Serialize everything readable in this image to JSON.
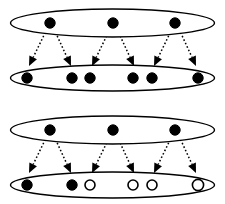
{
  "figure": {
    "type": "diagram",
    "background_color": "#ffffff",
    "stroke_color": "#000000",
    "fill_filled": "#000000",
    "fill_hollow": "#ffffff",
    "canvas": {
      "width": 225,
      "height": 204
    },
    "panels": [
      {
        "name": "upper-panel",
        "label": "",
        "ellipses": [
          {
            "name": "upper-panel-top-ellipse",
            "cx": 112.5,
            "cy": 23,
            "rx": 102,
            "ry": 14,
            "stroke_width": 1.4,
            "nodes": [
              {
                "name": "node-a1",
                "cx": 50,
                "cy": 23,
                "r": 5.2,
                "state": "filled",
                "label": ""
              },
              {
                "name": "node-a2",
                "cx": 113,
                "cy": 23,
                "r": 5.2,
                "state": "filled",
                "label": ""
              },
              {
                "name": "node-a3",
                "cx": 175,
                "cy": 23,
                "r": 5.2,
                "state": "filled",
                "label": ""
              }
            ]
          },
          {
            "name": "upper-panel-bottom-ellipse",
            "cx": 112.5,
            "cy": 78,
            "rx": 102,
            "ry": 13,
            "stroke_width": 1.4,
            "nodes": [
              {
                "name": "node-b1",
                "cx": 27,
                "cy": 78,
                "r": 5.2,
                "state": "filled",
                "label": ""
              },
              {
                "name": "node-b2",
                "cx": 72,
                "cy": 78,
                "r": 5.2,
                "state": "filled",
                "label": ""
              },
              {
                "name": "node-b3",
                "cx": 90,
                "cy": 78,
                "r": 5.2,
                "state": "filled",
                "label": ""
              },
              {
                "name": "node-b4",
                "cx": 133,
                "cy": 78,
                "r": 5.2,
                "state": "filled",
                "label": ""
              },
              {
                "name": "node-b5",
                "cx": 152,
                "cy": 78,
                "r": 5.2,
                "state": "filled",
                "label": ""
              },
              {
                "name": "node-b6",
                "cx": 198,
                "cy": 78,
                "r": 5.2,
                "state": "filled",
                "label": ""
              }
            ]
          }
        ],
        "arrows": [
          {
            "name": "arrow-a1-b1",
            "x1": 47,
            "y1": 29,
            "x2": 29,
            "y2": 66,
            "style": "dotted",
            "head": "solid-triangle"
          },
          {
            "name": "arrow-a1-b2",
            "x1": 54,
            "y1": 29,
            "x2": 71,
            "y2": 66,
            "style": "dotted",
            "head": "solid-triangle"
          },
          {
            "name": "arrow-a2-b3",
            "x1": 110,
            "y1": 29,
            "x2": 92,
            "y2": 66,
            "style": "dotted",
            "head": "solid-triangle"
          },
          {
            "name": "arrow-a2-b4",
            "x1": 117,
            "y1": 29,
            "x2": 134,
            "y2": 66,
            "style": "dotted",
            "head": "solid-triangle"
          },
          {
            "name": "arrow-a3-b5",
            "x1": 172,
            "y1": 29,
            "x2": 154,
            "y2": 66,
            "style": "dotted",
            "head": "solid-triangle"
          },
          {
            "name": "arrow-a3-b6",
            "x1": 179,
            "y1": 29,
            "x2": 196,
            "y2": 66,
            "style": "dotted",
            "head": "solid-triangle"
          }
        ]
      },
      {
        "name": "lower-panel",
        "label": "",
        "ellipses": [
          {
            "name": "lower-panel-top-ellipse",
            "cx": 112.5,
            "cy": 130,
            "rx": 102,
            "ry": 14,
            "stroke_width": 1.4,
            "nodes": [
              {
                "name": "node-c1",
                "cx": 50,
                "cy": 130,
                "r": 5.2,
                "state": "filled",
                "label": ""
              },
              {
                "name": "node-c2",
                "cx": 113,
                "cy": 130,
                "r": 5.2,
                "state": "filled",
                "label": ""
              },
              {
                "name": "node-c3",
                "cx": 175,
                "cy": 130,
                "r": 5.2,
                "state": "filled",
                "label": ""
              }
            ]
          },
          {
            "name": "lower-panel-bottom-ellipse",
            "cx": 112.5,
            "cy": 185,
            "rx": 102,
            "ry": 13,
            "stroke_width": 1.4,
            "nodes": [
              {
                "name": "node-d1",
                "cx": 27,
                "cy": 185,
                "r": 5.2,
                "state": "filled",
                "label": ""
              },
              {
                "name": "node-d2",
                "cx": 72,
                "cy": 185,
                "r": 5.2,
                "state": "filled",
                "label": ""
              },
              {
                "name": "node-d3",
                "cx": 90,
                "cy": 185,
                "r": 5.0,
                "state": "hollow",
                "label": ""
              },
              {
                "name": "node-d4",
                "cx": 133,
                "cy": 185,
                "r": 5.0,
                "state": "hollow",
                "label": ""
              },
              {
                "name": "node-d5",
                "cx": 152,
                "cy": 185,
                "r": 5.0,
                "state": "hollow",
                "label": ""
              },
              {
                "name": "node-d6",
                "cx": 198,
                "cy": 185,
                "r": 5.6,
                "state": "hollow",
                "label": ""
              }
            ]
          }
        ],
        "arrows": [
          {
            "name": "arrow-c1-d1",
            "x1": 47,
            "y1": 136,
            "x2": 29,
            "y2": 173,
            "style": "dotted",
            "head": "solid-triangle"
          },
          {
            "name": "arrow-c1-d2",
            "x1": 54,
            "y1": 136,
            "x2": 71,
            "y2": 173,
            "style": "dotted",
            "head": "solid-triangle"
          },
          {
            "name": "arrow-c2-d3",
            "x1": 110,
            "y1": 136,
            "x2": 92,
            "y2": 173,
            "style": "dotted",
            "head": "solid-triangle"
          },
          {
            "name": "arrow-c2-d4",
            "x1": 117,
            "y1": 136,
            "x2": 134,
            "y2": 173,
            "style": "dotted",
            "head": "solid-triangle"
          },
          {
            "name": "arrow-c3-d5",
            "x1": 172,
            "y1": 136,
            "x2": 154,
            "y2": 173,
            "style": "dotted",
            "head": "solid-triangle"
          },
          {
            "name": "arrow-c3-d6",
            "x1": 179,
            "y1": 136,
            "x2": 196,
            "y2": 173,
            "style": "dotted",
            "head": "solid-triangle"
          }
        ]
      }
    ]
  }
}
